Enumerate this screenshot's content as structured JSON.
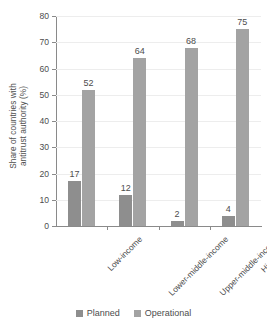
{
  "chart_data": {
    "type": "bar",
    "title": "",
    "subtitle": "",
    "xlabel": "",
    "ylabel": "Share of countries with\nantitrust authority (%)",
    "categories": [
      "Low-income",
      "Lower-middle-income",
      "Upper-middle-income",
      "High-income"
    ],
    "series": [
      {
        "name": "Planned",
        "color": "#8e8e8e",
        "values": [
          17,
          12,
          2,
          4
        ]
      },
      {
        "name": "Operational",
        "color": "#a3a3a3",
        "values": [
          52,
          64,
          68,
          75
        ]
      }
    ],
    "ylim": [
      0,
      80
    ],
    "y_ticks": [
      0,
      10,
      20,
      30,
      40,
      50,
      60,
      70,
      80
    ],
    "y_tick_labels": [
      "0",
      "10",
      "20",
      "30",
      "40",
      "50",
      "60",
      "70",
      "80"
    ],
    "grid": "horizontal",
    "legend_position": "bottom",
    "data_labels": true,
    "data_label_values": [
      "17",
      "52",
      "12",
      "64",
      "2",
      "68",
      "4",
      "75"
    ]
  },
  "legend": {
    "items": [
      {
        "label": "Planned",
        "color": "#8e8e8e"
      },
      {
        "label": "Operational",
        "color": "#a3a3a3"
      }
    ]
  },
  "axis": {
    "y_title": "Share of countries with\nantitrust authority (%)"
  }
}
